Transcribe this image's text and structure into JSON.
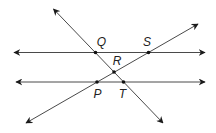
{
  "diagram": {
    "type": "geometry-lines",
    "colors": {
      "line": "#4a4a4a",
      "point": "#111111",
      "label": "#222222",
      "background": "#ffffff"
    },
    "lines": [
      {
        "id": "upper-horizontal",
        "x1": 14,
        "y1": 52.5,
        "x2": 205,
        "y2": 52.5,
        "arrows": "both"
      },
      {
        "id": "lower-horizontal",
        "x1": 16,
        "y1": 82,
        "x2": 205,
        "y2": 82,
        "arrows": "both"
      },
      {
        "id": "transversal-QRT",
        "x1": 53.5,
        "y1": 9,
        "x2": 163,
        "y2": 123,
        "arrows": "both"
      },
      {
        "id": "transversal-PRS",
        "x1": 26,
        "y1": 123,
        "x2": 198,
        "y2": 24,
        "arrows": "both"
      }
    ],
    "points": [
      {
        "name": "Q",
        "x": 95.5,
        "y": 52.5,
        "label_x": 101.5,
        "label_y": 41.5
      },
      {
        "name": "S",
        "x": 148.5,
        "y": 52.5,
        "label_x": 147,
        "label_y": 41.5
      },
      {
        "name": "R",
        "x": 114,
        "y": 72,
        "label_x": 117,
        "label_y": 61
      },
      {
        "name": "P",
        "x": 97,
        "y": 82,
        "label_x": 97.5,
        "label_y": 94
      },
      {
        "name": "T",
        "x": 123.5,
        "y": 82,
        "label_x": 122.5,
        "label_y": 94
      }
    ],
    "labels": {
      "Q": "Q",
      "S": "S",
      "R": "R",
      "P": "P",
      "T": "T"
    }
  }
}
